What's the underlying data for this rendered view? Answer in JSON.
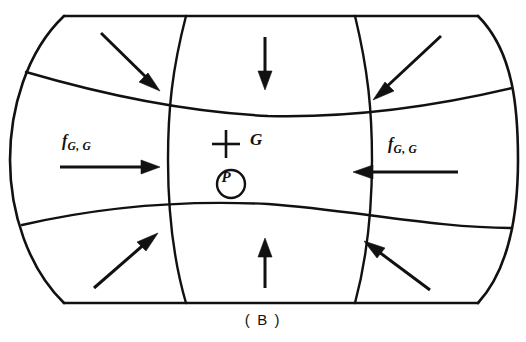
{
  "figure": {
    "caption": "( B )",
    "panel_id": "B",
    "type": "gravitational-field-convergence-diagram",
    "ink_color": "#111111",
    "background_color": "#ffffff"
  },
  "labels": {
    "force_left": {
      "symbol": "f",
      "subscript": "G, G"
    },
    "force_right": {
      "symbol": "f",
      "subscript": "G, G"
    },
    "center_mark": "G",
    "point_mark": "P"
  },
  "arrows": [
    {
      "name": "arrow-top-left",
      "direction": "down-right",
      "region": "top-left"
    },
    {
      "name": "arrow-top-center",
      "direction": "down",
      "region": "top-center"
    },
    {
      "name": "arrow-top-right",
      "direction": "down-left",
      "region": "top-right"
    },
    {
      "name": "arrow-middle-left",
      "direction": "right",
      "region": "middle-left"
    },
    {
      "name": "arrow-middle-right",
      "direction": "left",
      "region": "middle-right"
    },
    {
      "name": "arrow-bottom-left",
      "direction": "up-right",
      "region": "bottom-left"
    },
    {
      "name": "arrow-bottom-center",
      "direction": "up",
      "region": "bottom-center"
    },
    {
      "name": "arrow-bottom-right",
      "direction": "up-left",
      "region": "bottom-right"
    }
  ],
  "shape": {
    "outline": "barrel",
    "top_edge": "flat",
    "bottom_edge": "flat",
    "left_edge": "convex-arc",
    "right_edge": "convex-arc",
    "grid_rows": 3,
    "grid_columns": 3
  }
}
